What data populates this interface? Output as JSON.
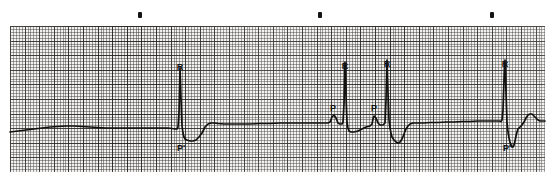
{
  "strip": {
    "title": "ECG rhythm strip",
    "width": 553,
    "height": 180,
    "paper": {
      "left": 10,
      "top": 26,
      "width": 535,
      "height": 146,
      "small_box_px": 2.92,
      "large_box_px": 14.6,
      "paper_color": "#f2f0ee",
      "fine_line_color": "#282828",
      "bold_line_color": "#191919"
    },
    "trace_color": "#111111",
    "baseline_y": 128
  },
  "event_markers": [
    {
      "name": "event-dot-1",
      "x": 140,
      "y": 15
    },
    {
      "name": "event-dot-2",
      "x": 320,
      "y": 15
    },
    {
      "name": "event-dot-3",
      "x": 492,
      "y": 15
    }
  ],
  "annotations": [
    {
      "id": "r1",
      "text": "R",
      "x": 180,
      "y": 63,
      "wave": "R",
      "position": "above"
    },
    {
      "id": "p1",
      "text": "P'",
      "x": 181,
      "y": 144,
      "wave": "P'",
      "position": "below"
    },
    {
      "id": "p2",
      "text": "P",
      "x": 333,
      "y": 104,
      "wave": "P",
      "position": "above"
    },
    {
      "id": "r2",
      "text": "R",
      "x": 345,
      "y": 62,
      "wave": "R",
      "position": "above"
    },
    {
      "id": "p3",
      "text": "P",
      "x": 374,
      "y": 104,
      "wave": "P",
      "position": "above"
    },
    {
      "id": "r3",
      "text": "R",
      "x": 387,
      "y": 60,
      "wave": "R",
      "position": "above"
    },
    {
      "id": "r4",
      "text": "R",
      "x": 505,
      "y": 60,
      "wave": "R",
      "position": "above"
    },
    {
      "id": "p4",
      "text": "P'",
      "x": 507,
      "y": 144,
      "wave": "P'",
      "position": "below"
    }
  ],
  "chart_data": {
    "type": "line",
    "xlabel": "time",
    "ylabel": "amplitude",
    "grid": true,
    "legend": "none",
    "xlim": [
      10,
      545
    ],
    "ylim": [
      172,
      26
    ],
    "baseline": 128,
    "series": [
      {
        "name": "ecg-trace",
        "comment": "pixel-space polyline, x left-to-right, y screen coords (smaller = higher amplitude)",
        "points": [
          [
            10,
            132
          ],
          [
            18,
            131
          ],
          [
            26,
            130
          ],
          [
            34,
            129
          ],
          [
            42,
            128
          ],
          [
            50,
            127
          ],
          [
            58,
            126.5
          ],
          [
            66,
            126
          ],
          [
            74,
            126
          ],
          [
            82,
            126.5
          ],
          [
            90,
            127
          ],
          [
            98,
            127.5
          ],
          [
            106,
            128
          ],
          [
            114,
            128
          ],
          [
            122,
            128
          ],
          [
            130,
            128
          ],
          [
            138,
            128
          ],
          [
            146,
            128
          ],
          [
            154,
            128
          ],
          [
            162,
            128
          ],
          [
            168,
            128
          ],
          [
            172,
            128.5
          ],
          [
            175,
            129
          ],
          [
            177,
            129
          ],
          [
            178,
            127
          ],
          [
            179,
            112
          ],
          [
            180,
            68
          ],
          [
            181,
            98
          ],
          [
            182,
            126
          ],
          [
            183,
            133
          ],
          [
            184,
            137
          ],
          [
            185,
            139
          ],
          [
            187,
            140
          ],
          [
            190,
            141
          ],
          [
            193,
            141
          ],
          [
            196,
            140
          ],
          [
            199,
            137
          ],
          [
            202,
            133
          ],
          [
            205,
            127
          ],
          [
            208,
            124
          ],
          [
            211,
            123
          ],
          [
            214,
            123
          ],
          [
            218,
            123.5
          ],
          [
            224,
            124
          ],
          [
            232,
            124
          ],
          [
            240,
            124
          ],
          [
            250,
            124
          ],
          [
            260,
            123.5
          ],
          [
            270,
            123.5
          ],
          [
            280,
            123
          ],
          [
            290,
            123
          ],
          [
            300,
            123
          ],
          [
            310,
            123
          ],
          [
            318,
            123
          ],
          [
            324,
            123
          ],
          [
            328,
            123
          ],
          [
            330,
            122
          ],
          [
            332,
            117
          ],
          [
            334,
            115
          ],
          [
            336,
            118
          ],
          [
            338,
            123
          ],
          [
            340,
            124
          ],
          [
            342,
            124
          ],
          [
            343,
            122
          ],
          [
            344,
            104
          ],
          [
            345,
            62
          ],
          [
            346,
            96
          ],
          [
            347,
            122
          ],
          [
            348,
            128
          ],
          [
            349,
            131
          ],
          [
            351,
            132
          ],
          [
            354,
            132
          ],
          [
            358,
            131
          ],
          [
            362,
            129
          ],
          [
            366,
            127
          ],
          [
            370,
            126
          ],
          [
            372,
            124
          ],
          [
            373,
            119
          ],
          [
            374,
            116
          ],
          [
            376,
            118
          ],
          [
            378,
            123
          ],
          [
            380,
            125
          ],
          [
            383,
            125
          ],
          [
            385,
            123
          ],
          [
            386,
            100
          ],
          [
            387,
            60
          ],
          [
            388,
            92
          ],
          [
            389,
            120
          ],
          [
            390,
            128
          ],
          [
            391,
            133
          ],
          [
            392,
            137
          ],
          [
            394,
            140
          ],
          [
            396,
            142
          ],
          [
            398,
            143
          ],
          [
            400,
            142
          ],
          [
            402,
            139
          ],
          [
            404,
            134
          ],
          [
            406,
            129
          ],
          [
            408,
            126
          ],
          [
            410,
            124
          ],
          [
            413,
            123
          ],
          [
            418,
            123
          ],
          [
            424,
            123
          ],
          [
            430,
            122.5
          ],
          [
            438,
            122.5
          ],
          [
            446,
            122
          ],
          [
            454,
            122
          ],
          [
            462,
            121.5
          ],
          [
            470,
            121.5
          ],
          [
            478,
            121
          ],
          [
            486,
            121
          ],
          [
            492,
            121
          ],
          [
            496,
            121
          ],
          [
            499,
            121
          ],
          [
            501,
            121.5
          ],
          [
            502,
            120
          ],
          [
            503,
            110
          ],
          [
            504,
            80
          ],
          [
            505,
            60
          ],
          [
            506,
            92
          ],
          [
            507,
            122
          ],
          [
            508,
            132
          ],
          [
            509,
            138
          ],
          [
            510,
            142
          ],
          [
            511,
            145
          ],
          [
            512,
            147
          ],
          [
            513,
            147
          ],
          [
            514,
            145
          ],
          [
            515,
            141
          ],
          [
            516,
            136
          ],
          [
            517,
            132
          ],
          [
            518,
            129
          ],
          [
            520,
            127
          ],
          [
            522,
            125
          ],
          [
            524,
            122
          ],
          [
            526,
            118
          ],
          [
            528,
            115
          ],
          [
            530,
            114
          ],
          [
            532,
            114
          ],
          [
            534,
            116
          ],
          [
            536,
            118
          ],
          [
            538,
            120
          ],
          [
            540,
            121
          ],
          [
            543,
            121
          ],
          [
            545,
            121
          ]
        ]
      }
    ]
  }
}
